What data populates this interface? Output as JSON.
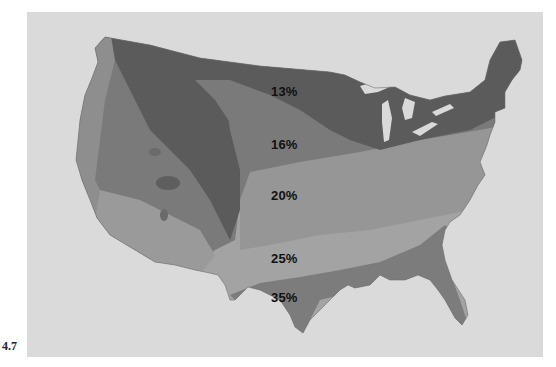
{
  "figure": {
    "number": "4.7"
  },
  "map": {
    "region": "Contiguous United States",
    "background_color": "#dadada",
    "zones": [
      {
        "id": "z13",
        "label": "13%",
        "color": "#5a5a5a"
      },
      {
        "id": "z16",
        "label": "16%",
        "color": "#7a7a7a"
      },
      {
        "id": "z20",
        "label": "20%",
        "color": "#969696"
      },
      {
        "id": "z25",
        "label": "25%",
        "color": "#a3a3a3"
      },
      {
        "id": "z35",
        "label": "35%",
        "color": "#7c7c7c"
      }
    ],
    "labels": [
      {
        "text": "13%",
        "x": 271,
        "y": 84
      },
      {
        "text": "16%",
        "x": 271,
        "y": 137
      },
      {
        "text": "20%",
        "x": 271,
        "y": 188
      },
      {
        "text": "25%",
        "x": 271,
        "y": 251
      },
      {
        "text": "35%",
        "x": 271,
        "y": 290
      }
    ]
  }
}
